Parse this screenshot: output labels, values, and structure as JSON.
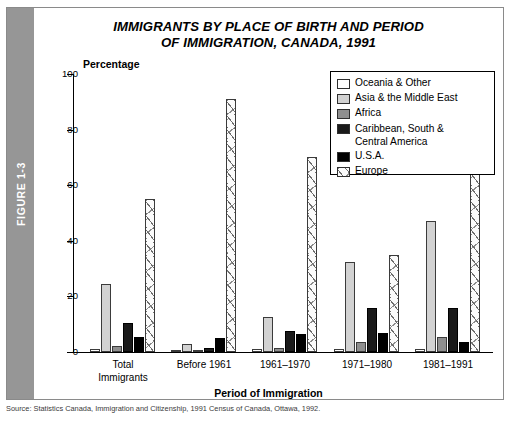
{
  "figure": {
    "spine_label": "FIGURE 1-3",
    "title": "IMMIGRANTS BY PLACE OF BIRTH AND PERIOD\nOF IMMIGRATION, CANADA, 1991",
    "title_line1": "IMMIGRANTS BY PLACE OF BIRTH AND PERIOD",
    "title_line2": "OF IMMIGRATION, CANADA, 1991",
    "caption": "Source: Statistics Canada, Immigration and Citizenship, 1991 Census of Canada, Ottawa, 1992."
  },
  "axes": {
    "y_title": "Percentage",
    "y_ticks": [
      "0",
      "20",
      "40",
      "60",
      "80",
      "100"
    ],
    "x_title": "Period of Immigration"
  },
  "legend": {
    "items": [
      {
        "label": "Oceania & Other",
        "swatch": "white"
      },
      {
        "label": "Asia & the Middle East",
        "swatch": "light-gray"
      },
      {
        "label": "Africa",
        "swatch": "medium-gray"
      },
      {
        "label": "Caribbean, South &\n    Central America",
        "swatch": "black"
      },
      {
        "label": "U.S.A.",
        "swatch": "black"
      },
      {
        "label": "Europe",
        "swatch": "hatched"
      }
    ]
  },
  "chart_data": {
    "type": "bar",
    "title": "IMMIGRANTS BY PLACE OF BIRTH AND PERIOD OF IMMIGRATION, CANADA, 1991",
    "xlabel": "Period of Immigration",
    "ylabel": "Percentage",
    "ylim": [
      0,
      100
    ],
    "yticks": [
      0,
      20,
      40,
      60,
      80,
      100
    ],
    "grid": false,
    "legend_position": "top-right",
    "categories": [
      "Total Immigrants",
      "Before 1961",
      "1961–1970",
      "1971–1980",
      "1981–1991"
    ],
    "category_labels": [
      [
        "Total",
        "Immigrants"
      ],
      [
        "Before 1961",
        ""
      ],
      [
        "1961–1970",
        ""
      ],
      [
        "1971–1980",
        ""
      ],
      [
        "1981–1991",
        ""
      ]
    ],
    "series": [
      {
        "name": "Oceania & Other",
        "color": "#ffffff",
        "values": [
          1,
          0.5,
          1,
          1,
          1
        ]
      },
      {
        "name": "Asia & the Middle East",
        "color": "#d2d2d2",
        "values": [
          24.5,
          3,
          12.5,
          32.5,
          47
        ]
      },
      {
        "name": "Africa",
        "color": "#8f8f8f",
        "values": [
          2,
          0.5,
          1.5,
          3.5,
          5.5
        ]
      },
      {
        "name": "Caribbean, South & Central America",
        "color": "#1a1a1a",
        "values": [
          10.5,
          1.5,
          7.5,
          16,
          16
        ]
      },
      {
        "name": "U.S.A.",
        "color": "#000000",
        "values": [
          5.5,
          5,
          6.5,
          7,
          3.5
        ]
      },
      {
        "name": "Europe",
        "color": "hatched",
        "values": [
          55,
          91,
          70,
          35,
          70
        ]
      }
    ]
  }
}
